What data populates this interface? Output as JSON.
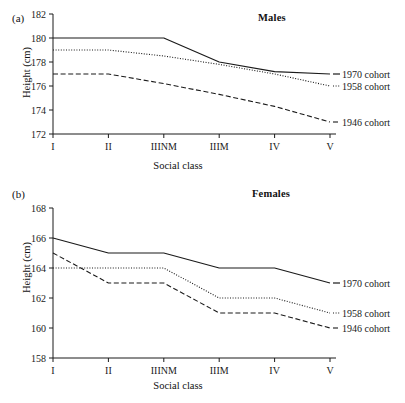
{
  "figure": {
    "background": "#ffffff",
    "ink_color": "#1a1a1a"
  },
  "chart_data": [
    {
      "type": "line",
      "panel_letter": "(a)",
      "title": "Males",
      "xlabel": "Social class",
      "ylabel": "Height (cm)",
      "categories": [
        "I",
        "II",
        "IIINM",
        "IIIM",
        "IV",
        "V"
      ],
      "ylim": [
        172,
        182
      ],
      "yticks": [
        172,
        174,
        176,
        178,
        180,
        182
      ],
      "grid": false,
      "legend_position": "right-of-axes",
      "series": [
        {
          "name": "1970 cohort",
          "style": "solid",
          "values": [
            180.0,
            180.0,
            180.0,
            178.0,
            177.2,
            177.0
          ]
        },
        {
          "name": "1958 cohort",
          "style": "dotted",
          "values": [
            179.0,
            179.0,
            178.5,
            177.8,
            177.0,
            176.0
          ]
        },
        {
          "name": "1946 cohort",
          "style": "dashed",
          "values": [
            177.0,
            177.0,
            176.2,
            175.3,
            174.3,
            173.0
          ]
        }
      ]
    },
    {
      "type": "line",
      "panel_letter": "(b)",
      "title": "Females",
      "xlabel": "Social class",
      "ylabel": "Height (cm)",
      "categories": [
        "I",
        "II",
        "IIINM",
        "IIIM",
        "IV",
        "V"
      ],
      "ylim": [
        158,
        168
      ],
      "yticks": [
        158,
        160,
        162,
        164,
        166,
        168
      ],
      "grid": false,
      "legend_position": "right-of-axes",
      "series": [
        {
          "name": "1970 cohort",
          "style": "solid",
          "values": [
            166.0,
            165.0,
            165.0,
            164.0,
            164.0,
            163.0
          ]
        },
        {
          "name": "1958 cohort",
          "style": "dotted",
          "values": [
            164.0,
            164.0,
            164.0,
            162.0,
            162.0,
            161.0
          ]
        },
        {
          "name": "1946 cohort",
          "style": "dashed",
          "values": [
            165.0,
            163.0,
            163.0,
            161.0,
            161.0,
            160.0
          ]
        }
      ]
    }
  ]
}
